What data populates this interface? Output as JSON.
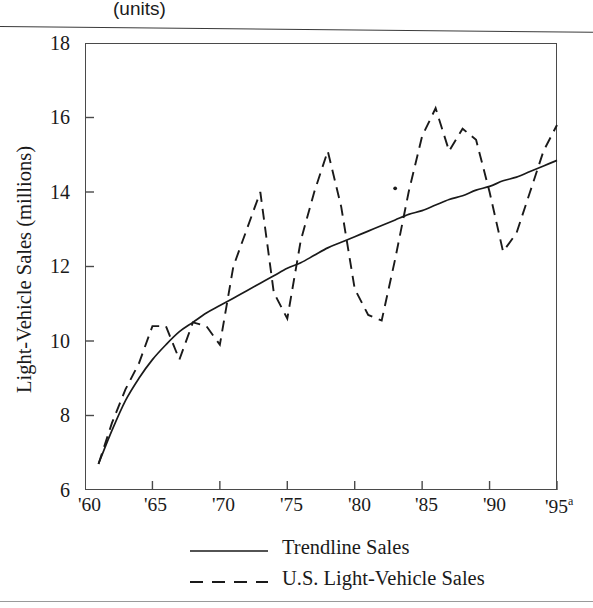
{
  "header": {
    "units_label": "(units)"
  },
  "chart_data": {
    "type": "line",
    "title": "",
    "subtitle": "",
    "xlabel": "",
    "ylabel": "Light-Vehicle Sales (millions)",
    "xlim": [
      1960,
      1995
    ],
    "ylim": [
      6,
      18
    ],
    "grid": false,
    "legend_position": "bottom",
    "x_tick_labels": [
      "'60",
      "'65",
      "'70",
      "'75",
      "'80",
      "'85",
      "'90",
      "'95"
    ],
    "x_tick_values": [
      1960,
      1965,
      1970,
      1975,
      1980,
      1985,
      1990,
      1995
    ],
    "x_last_tick_superscript": "a",
    "y_tick_labels": [
      "18",
      "16",
      "14",
      "12",
      "10",
      "8",
      "6"
    ],
    "y_tick_values": [
      18,
      16,
      14,
      12,
      10,
      8,
      6
    ],
    "series": [
      {
        "name": "Trendline Sales",
        "style": "solid",
        "color": "#1a1a1a",
        "x": [
          1961,
          1962,
          1963,
          1964,
          1965,
          1966,
          1967,
          1968,
          1969,
          1970,
          1971,
          1972,
          1973,
          1974,
          1975,
          1976,
          1977,
          1978,
          1979,
          1980,
          1981,
          1982,
          1983,
          1984,
          1985,
          1986,
          1987,
          1988,
          1989,
          1990,
          1991,
          1992,
          1993,
          1994,
          1995
        ],
        "values": [
          6.7,
          7.6,
          8.4,
          9.0,
          9.5,
          9.9,
          10.25,
          10.5,
          10.75,
          10.95,
          11.15,
          11.35,
          11.55,
          11.75,
          11.95,
          12.1,
          12.3,
          12.5,
          12.65,
          12.8,
          12.95,
          13.1,
          13.25,
          13.4,
          13.5,
          13.65,
          13.8,
          13.9,
          14.05,
          14.15,
          14.3,
          14.4,
          14.55,
          14.7,
          14.85
        ]
      },
      {
        "name": "U.S. Light-Vehicle Sales",
        "style": "dashed",
        "color": "#1a1a1a",
        "x": [
          1961,
          1962,
          1963,
          1964,
          1965,
          1966,
          1967,
          1968,
          1969,
          1970,
          1971,
          1972,
          1973,
          1974,
          1975,
          1976,
          1977,
          1978,
          1979,
          1980,
          1981,
          1982,
          1983,
          1984,
          1985,
          1986,
          1987,
          1988,
          1989,
          1990,
          1991,
          1992,
          1993,
          1994,
          1995
        ],
        "values": [
          6.7,
          7.8,
          8.7,
          9.4,
          10.4,
          10.4,
          9.5,
          10.5,
          10.4,
          9.9,
          12.0,
          13.0,
          14.0,
          11.3,
          10.6,
          12.7,
          14.0,
          15.1,
          13.6,
          11.4,
          10.7,
          10.55,
          12.2,
          14.0,
          15.5,
          16.25,
          15.1,
          15.7,
          15.4,
          14.0,
          12.4,
          12.9,
          14.0,
          15.1,
          15.8
        ]
      }
    ],
    "annotations": [
      {
        "text": "dot marker near 1983 at ~14.1",
        "x": 1983,
        "y": 14.1
      }
    ]
  },
  "legend": {
    "items": [
      {
        "label": "Trendline Sales",
        "style": "solid"
      },
      {
        "label": "U.S. Light-Vehicle Sales",
        "style": "dashed"
      }
    ]
  }
}
